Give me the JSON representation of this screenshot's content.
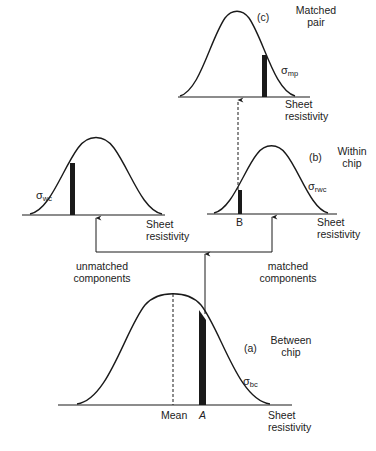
{
  "panels": {
    "c": {
      "tag": "(c)",
      "title_line1": "Matched",
      "title_line2": "pair",
      "sigma": "σ",
      "sigma_sub": "mp",
      "axis_line1": "Sheet",
      "axis_line2": "resistivity"
    },
    "wc": {
      "sigma": "σ",
      "sigma_sub": "wc",
      "axis_line1": "Sheet",
      "axis_line2": "resistivity"
    },
    "b": {
      "tag": "(b)",
      "title_line1": "Within",
      "title_line2": "chip",
      "sigma": "σ",
      "sigma_sub": "rwc",
      "marker": "B",
      "axis_line1": "Sheet",
      "axis_line2": "resistivity"
    },
    "a": {
      "tag": "(a)",
      "title_line1": "Between",
      "title_line2": "chip",
      "sigma": "σ",
      "sigma_sub": "bc",
      "mean_label": "Mean",
      "marker": "A",
      "axis_line1": "Sheet",
      "axis_line2": "resistivity"
    }
  },
  "connectors": {
    "left_line1": "unmatched",
    "left_line2": "components",
    "right_line1": "matched",
    "right_line2": "components"
  },
  "colors": {
    "ink": "#1a1a1a",
    "background": "#ffffff"
  }
}
